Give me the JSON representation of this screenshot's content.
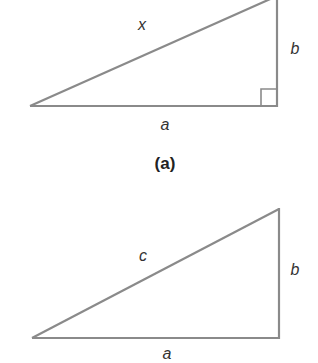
{
  "figure_a": {
    "hypotenuse_label": "x",
    "vertical_label": "b",
    "base_label": "a",
    "caption": "(a)",
    "right_angle_marker": true
  },
  "figure_b": {
    "hypotenuse_label": "c",
    "vertical_label": "b",
    "base_label": "a",
    "right_angle_marker": false
  },
  "colors": {
    "line": "#8a8a8a",
    "text": "#333333",
    "background": "#ffffff"
  }
}
